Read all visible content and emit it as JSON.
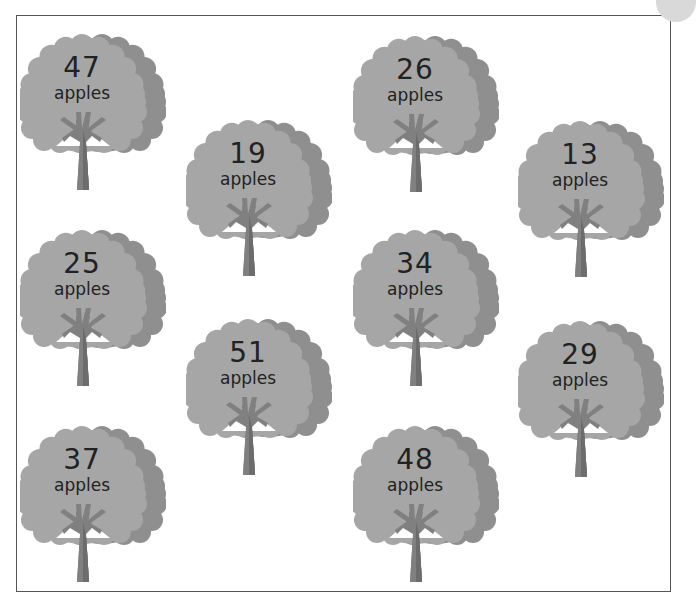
{
  "worksheet": {
    "unit_label": "apples",
    "colors": {
      "canopy": "#a6a6a6",
      "canopy_shadow": "#8f8f8f",
      "trunk": "#808080",
      "trunk_shadow": "#6c6c6c",
      "text": "#222222",
      "border": "#555555"
    },
    "trees": [
      {
        "count": "47",
        "unit": "apples",
        "x": 20,
        "y": 24
      },
      {
        "count": "19",
        "unit": "apples",
        "x": 186,
        "y": 110
      },
      {
        "count": "26",
        "unit": "apples",
        "x": 353,
        "y": 26
      },
      {
        "count": "13",
        "unit": "apples",
        "x": 518,
        "y": 111
      },
      {
        "count": "25",
        "unit": "apples",
        "x": 20,
        "y": 220
      },
      {
        "count": "34",
        "unit": "apples",
        "x": 353,
        "y": 220
      },
      {
        "count": "51",
        "unit": "apples",
        "x": 186,
        "y": 309
      },
      {
        "count": "29",
        "unit": "apples",
        "x": 518,
        "y": 311
      },
      {
        "count": "37",
        "unit": "apples",
        "x": 20,
        "y": 416
      },
      {
        "count": "48",
        "unit": "apples",
        "x": 353,
        "y": 416
      }
    ]
  }
}
